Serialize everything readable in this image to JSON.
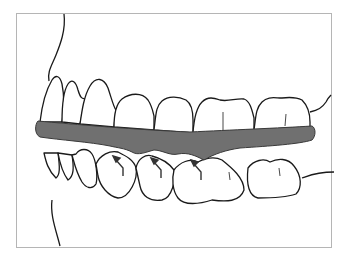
{
  "figure": {
    "colors": {
      "background": "#ffffff",
      "frame": "#b5b5b5",
      "outline": "#1a1a1a",
      "splint_fill": "#707070",
      "splint_stroke": "#3a3a3a",
      "arrow": "#333333"
    },
    "labels": []
  }
}
